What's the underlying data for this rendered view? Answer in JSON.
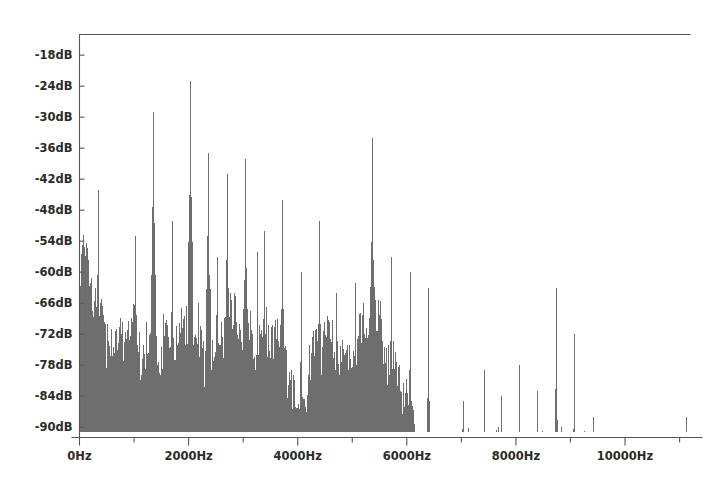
{
  "figure": {
    "title": "",
    "background_color": "#ffffff",
    "frame_color": "#555555",
    "spectrum_color": "#6e6e6e"
  },
  "chart_data": {
    "type": "area",
    "title": "",
    "xlabel": "",
    "ylabel": "",
    "xlim": [
      0,
      11200
    ],
    "ylim": [
      -92,
      -14
    ],
    "grid": false,
    "legend": null,
    "x_unit": "Hz",
    "y_unit": "dB",
    "x_tick_labels": [
      "0Hz",
      "2000Hz",
      "4000Hz",
      "6000Hz",
      "8000Hz",
      "10000Hz"
    ],
    "x_tick_values": [
      0,
      2000,
      4000,
      6000,
      8000,
      10000
    ],
    "x_minor_tick_values": [
      1000,
      3000,
      5000,
      7000,
      9000,
      11000
    ],
    "y_tick_labels": [
      "-18dB",
      "-24dB",
      "-30dB",
      "-36dB",
      "-42dB",
      "-48dB",
      "-54dB",
      "-60dB",
      "-66dB",
      "-72dB",
      "-78dB",
      "-84dB",
      "-90dB"
    ],
    "y_tick_values": [
      -18,
      -24,
      -30,
      -36,
      -42,
      -48,
      -54,
      -60,
      -66,
      -72,
      -78,
      -84,
      -90
    ],
    "baseline_db": -91,
    "peaks": [
      {
        "freq": 120,
        "db": -61
      },
      {
        "freq": 180,
        "db": -63
      },
      {
        "freq": 250,
        "db": -66
      },
      {
        "freq": 330,
        "db": -44
      },
      {
        "freq": 500,
        "db": -70
      },
      {
        "freq": 660,
        "db": -71
      },
      {
        "freq": 1000,
        "db": -53
      },
      {
        "freq": 1340,
        "db": -29
      },
      {
        "freq": 1520,
        "db": -68
      },
      {
        "freq": 1680,
        "db": -50
      },
      {
        "freq": 2020,
        "db": -23
      },
      {
        "freq": 2350,
        "db": -37
      },
      {
        "freq": 2520,
        "db": -57
      },
      {
        "freq": 2700,
        "db": -41
      },
      {
        "freq": 3030,
        "db": -38
      },
      {
        "freq": 3250,
        "db": -56
      },
      {
        "freq": 3380,
        "db": -52
      },
      {
        "freq": 3700,
        "db": -46
      },
      {
        "freq": 4050,
        "db": -60
      },
      {
        "freq": 4380,
        "db": -50
      },
      {
        "freq": 4700,
        "db": -64
      },
      {
        "freq": 5050,
        "db": -62
      },
      {
        "freq": 5350,
        "db": -34
      },
      {
        "freq": 5700,
        "db": -57
      },
      {
        "freq": 6050,
        "db": -60
      },
      {
        "freq": 6380,
        "db": -63
      },
      {
        "freq": 7020,
        "db": -85
      },
      {
        "freq": 7400,
        "db": -79
      },
      {
        "freq": 7720,
        "db": -84
      },
      {
        "freq": 8050,
        "db": -78
      },
      {
        "freq": 8380,
        "db": -83
      },
      {
        "freq": 8720,
        "db": -63
      },
      {
        "freq": 9060,
        "db": -72
      },
      {
        "freq": 9400,
        "db": -88
      },
      {
        "freq": 11100,
        "db": -88
      }
    ],
    "noise_floor_envelope": [
      {
        "freq": 0,
        "db": -62
      },
      {
        "freq": 90,
        "db": -60
      },
      {
        "freq": 200,
        "db": -64
      },
      {
        "freq": 330,
        "db": -68
      },
      {
        "freq": 500,
        "db": -72
      },
      {
        "freq": 700,
        "db": -74
      },
      {
        "freq": 900,
        "db": -73
      },
      {
        "freq": 1100,
        "db": -76
      },
      {
        "freq": 1340,
        "db": -71
      },
      {
        "freq": 1600,
        "db": -77
      },
      {
        "freq": 1850,
        "db": -75
      },
      {
        "freq": 2020,
        "db": -72
      },
      {
        "freq": 2300,
        "db": -76
      },
      {
        "freq": 2600,
        "db": -74
      },
      {
        "freq": 2900,
        "db": -70
      },
      {
        "freq": 3050,
        "db": -69
      },
      {
        "freq": 3300,
        "db": -74
      },
      {
        "freq": 3600,
        "db": -76
      },
      {
        "freq": 3850,
        "db": -80
      },
      {
        "freq": 4000,
        "db": -88
      },
      {
        "freq": 4120,
        "db": -84
      },
      {
        "freq": 4300,
        "db": -78
      },
      {
        "freq": 4600,
        "db": -76
      },
      {
        "freq": 4900,
        "db": -75
      },
      {
        "freq": 5200,
        "db": -73
      },
      {
        "freq": 5400,
        "db": -72
      },
      {
        "freq": 5700,
        "db": -76
      },
      {
        "freq": 5950,
        "db": -82
      },
      {
        "freq": 6100,
        "db": -90
      },
      {
        "freq": 11200,
        "db": -91
      }
    ]
  }
}
